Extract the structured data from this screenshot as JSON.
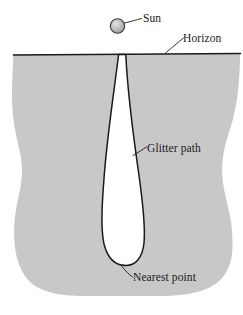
{
  "figure": {
    "background_color": "#ffffff",
    "water_fill_color": "#c8c8c8",
    "glitter_fill_color": "#ffffff",
    "outline_color": "#1a1a1a",
    "sun_fill_color": "#b4b4b4",
    "labels": {
      "sun": "Sun",
      "horizon": "Horizon",
      "glitter_path": "Glitter path",
      "nearest_point": "Nearest point"
    },
    "elements": {
      "sun_icon": "sun-circle",
      "horizon_line": "horizon-line",
      "water_region": "water-region",
      "glitter_region": "glitter-path-region"
    }
  }
}
